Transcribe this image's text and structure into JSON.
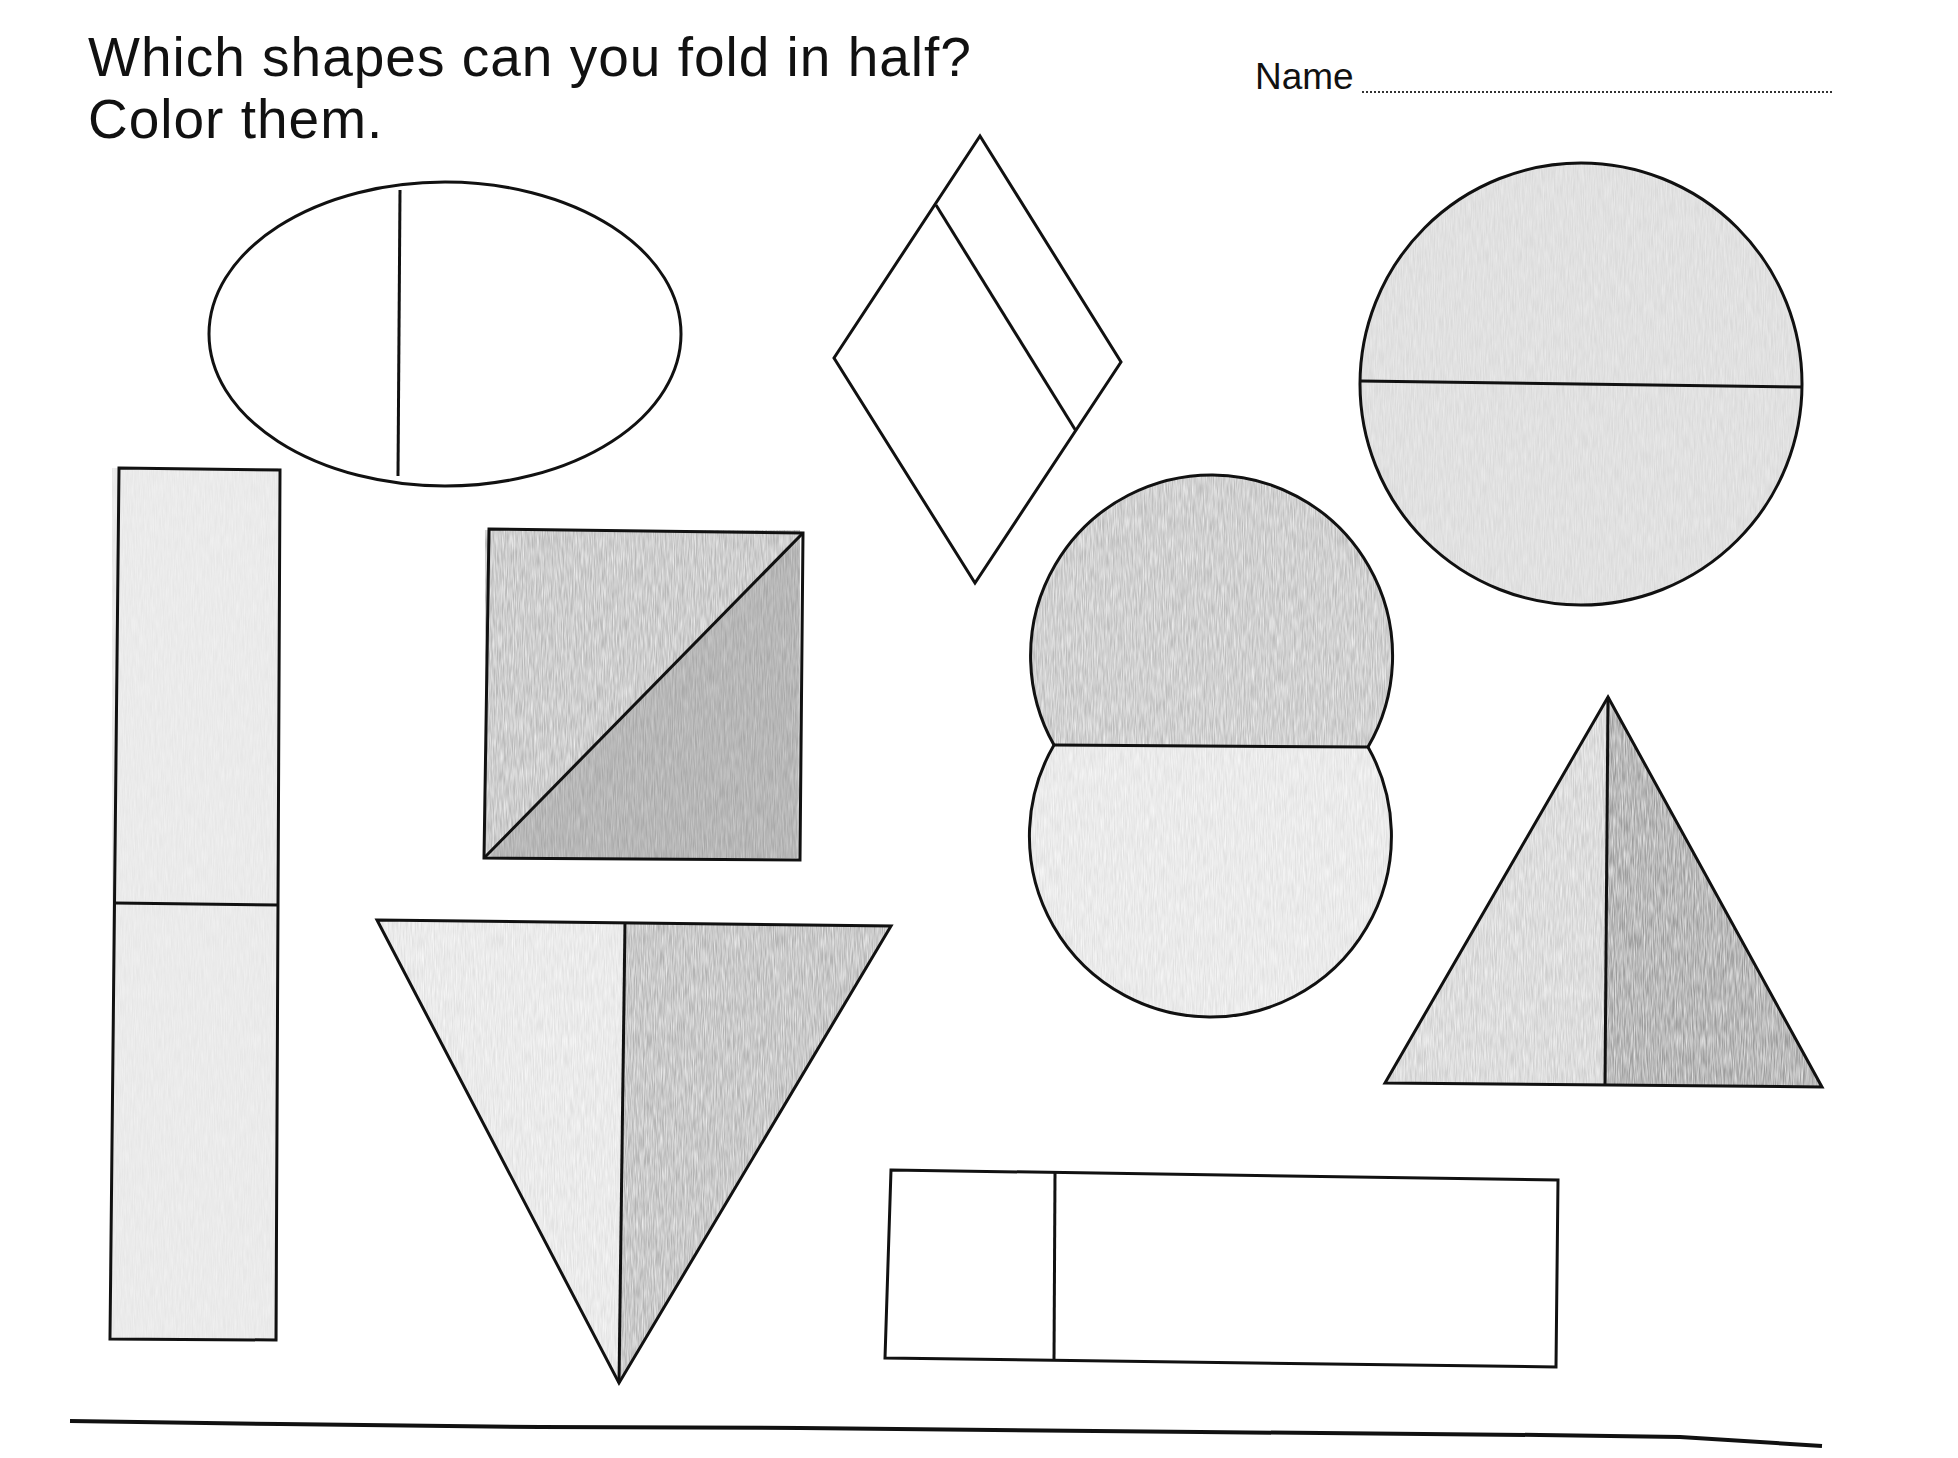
{
  "worksheet": {
    "instruction_line1": "Which shapes can you fold in half?",
    "instruction_line2": "Color them.",
    "name_label": "Name",
    "name_value": ""
  },
  "colors": {
    "ink": "#111111",
    "crayon_light": "#dcdcdc",
    "crayon_mid": "#bdbdbd",
    "crayon_dark": "#9a9a9a",
    "paper": "#ffffff"
  },
  "shapes": [
    {
      "id": "oval",
      "type": "ellipse",
      "split": "off-center vertical",
      "colored": false
    },
    {
      "id": "rhombus",
      "type": "rhombus",
      "split": "off-center diagonal",
      "colored": false
    },
    {
      "id": "circle",
      "type": "circle",
      "split": "horizontal halves",
      "colored": true
    },
    {
      "id": "tall-rectangle",
      "type": "rectangle",
      "split": "horizontal halves",
      "colored": true
    },
    {
      "id": "square",
      "type": "square",
      "split": "diagonal halves",
      "colored": true
    },
    {
      "id": "down-triangle",
      "type": "triangle",
      "split": "vertical halves",
      "colored": true
    },
    {
      "id": "double-circle",
      "type": "double circle",
      "split": "horizontal halves",
      "colored": true
    },
    {
      "id": "up-triangle",
      "type": "triangle",
      "split": "vertical halves",
      "colored": true
    },
    {
      "id": "wide-rectangle",
      "type": "rectangle",
      "split": "off-center vertical",
      "colored": false
    }
  ]
}
